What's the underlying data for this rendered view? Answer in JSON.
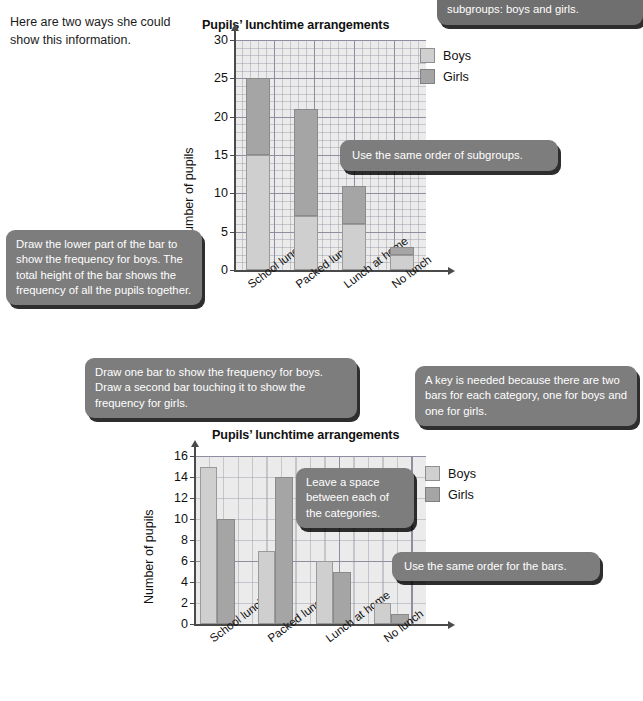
{
  "intro": {
    "text": "Here are two ways she could show this information."
  },
  "callouts": {
    "top_right": "bar is divided to show the two subgroups: boys and girls.",
    "same_order_subgroups": "Use the same order of subgroups.",
    "lower_part": "Draw the lower part of the bar to show the frequency for boys. The total height of the bar shows the frequency of all the pupils together.",
    "draw_one_bar": "Draw one bar to show the frequency for boys. Draw a second bar touching it to show the frequency for girls.",
    "key_needed": "A key is needed because there are two bars for each category, one for boys and one for girls.",
    "leave_space": "Leave a space between each of the categories.",
    "same_order_bars": "Use the same order for the bars."
  },
  "legend": {
    "boys_label": "Boys",
    "girls_label": "Girls",
    "boys_color": "#cfcfcf",
    "girls_color": "#a5a5a5"
  },
  "chart_data": [
    {
      "type": "bar",
      "variant": "stacked",
      "title": "Pupils’ lunchtime arrangements",
      "xlabel": "",
      "ylabel": "Number of pupils",
      "categories": [
        "School lunch",
        "Packed lunch",
        "Lunch at home",
        "No lunch"
      ],
      "series": [
        {
          "name": "Boys",
          "values": [
            15,
            7,
            6,
            2
          ],
          "color": "#cfcfcf"
        },
        {
          "name": "Girls",
          "values": [
            10,
            14,
            5,
            1
          ],
          "color": "#a5a5a5"
        }
      ],
      "totals": [
        25,
        21,
        11,
        3
      ],
      "yticks": [
        0,
        5,
        10,
        15,
        20,
        25,
        30
      ],
      "ylim": [
        0,
        30
      ],
      "grid": true,
      "legend_position": "top-right"
    },
    {
      "type": "bar",
      "variant": "grouped",
      "title": "Pupils’ lunchtime arrangements",
      "xlabel": "",
      "ylabel": "Number of pupils",
      "categories": [
        "School lunch",
        "Packed lunch",
        "Lunch at home",
        "No lunch"
      ],
      "series": [
        {
          "name": "Boys",
          "values": [
            15,
            7,
            6,
            2
          ],
          "color": "#cfcfcf"
        },
        {
          "name": "Girls",
          "values": [
            10,
            14,
            5,
            1
          ],
          "color": "#a5a5a5"
        }
      ],
      "yticks": [
        0,
        2,
        4,
        6,
        8,
        10,
        12,
        14,
        16
      ],
      "ylim": [
        0,
        16
      ],
      "grid": true,
      "legend_position": "top-right"
    }
  ]
}
